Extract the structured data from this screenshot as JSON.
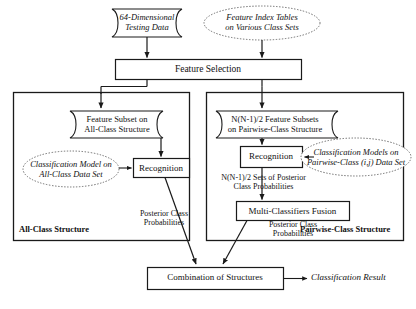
{
  "diagram": {
    "colors": {
      "stroke": "#1a1a1a",
      "dotted_stroke": "#6b6b6b",
      "text": "#111111",
      "background": "#ffffff"
    },
    "nodes": {
      "testing_data": {
        "line1": "64-Dimensional",
        "line2": "Testing Data",
        "shape": "banner",
        "style": "italic"
      },
      "feature_index_tables": {
        "line1": "Feature Index Tables",
        "line2": "on Various Class Sets",
        "shape": "dotted-ellipse",
        "style": "italic"
      },
      "feature_selection": {
        "label": "Feature Selection",
        "shape": "rectangle"
      },
      "feature_subset_all_class": {
        "line1": "Feature Subset on",
        "line2": "All-Class Structure",
        "shape": "banner"
      },
      "classification_model_all_class": {
        "line1": "Classification Model on",
        "line2": "All-Class Data Set",
        "shape": "dotted-ellipse",
        "style": "italic"
      },
      "recognition_left": {
        "label": "Recognition",
        "shape": "rectangle"
      },
      "feature_subsets_pairwise": {
        "line1": "N(N-1)/2 Feature Subsets",
        "line2": "on Pairwise-Class Structure",
        "shape": "banner"
      },
      "classification_models_pairwise": {
        "line1": "Classification Models on",
        "line2": "Pairwise-Class (i,j) Data Set",
        "shape": "dotted-ellipse",
        "style": "italic"
      },
      "recognition_right": {
        "label": "Recognition",
        "shape": "rectangle"
      },
      "multi_classifiers_fusion": {
        "label": "Multi-Classifiers Fusion",
        "shape": "rectangle"
      },
      "combination_of_structures": {
        "label": "Combination of Structures",
        "shape": "rectangle"
      },
      "classification_result": {
        "label": "Classification Result",
        "shape": "text",
        "style": "italic"
      }
    },
    "edge_labels": {
      "posterior_left": {
        "line1": "Posterior Class",
        "line2": "Probabilities"
      },
      "posterior_sets_right": {
        "line1": "N(N-1)/2 Sets of Posterior",
        "line2": "Class Probabilities"
      },
      "posterior_right": {
        "line1": "Posterior Class",
        "line2": "Probabilities"
      }
    },
    "panels": {
      "all_class": {
        "label": "All-Class Structure"
      },
      "pairwise_class": {
        "label": "Pairwise-Class Structure"
      }
    }
  }
}
